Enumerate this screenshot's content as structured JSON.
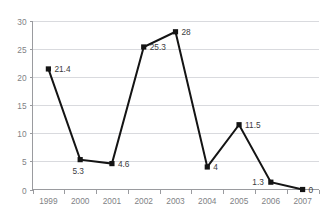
{
  "chart_data": {
    "type": "line",
    "title": "",
    "xlabel": "",
    "ylabel": "",
    "categories": [
      "1999",
      "2000",
      "2001",
      "2002",
      "2003",
      "2004",
      "2005",
      "2006",
      "2007"
    ],
    "values": [
      21.4,
      5.3,
      4.6,
      25.3,
      28,
      4,
      11.5,
      1.3,
      0
    ],
    "point_labels": [
      "21.4",
      "5.3",
      "4.6",
      "25.3",
      "28",
      "4",
      "11.5",
      "1.3",
      "0"
    ],
    "label_positions": [
      "right",
      "below-left",
      "right",
      "right",
      "right",
      "right",
      "right",
      "left",
      "right"
    ],
    "ylim": [
      0,
      30
    ],
    "yticks": [
      0,
      5,
      10,
      15,
      20,
      25,
      30
    ],
    "ytick_labels": [
      "0",
      "5",
      "10",
      "15",
      "20",
      "25",
      "30"
    ],
    "grid": true,
    "grid_orientation": "horizontal",
    "legend": false,
    "legend_position": "none",
    "marker": "square",
    "colors": {
      "series_line": "#141414",
      "marker": "#141414",
      "gridline": "#d9dade",
      "axis": "#9a9b9f",
      "tick_text": "#808285",
      "data_label_text": "#3b3b3d",
      "background": "#ffffff"
    }
  }
}
